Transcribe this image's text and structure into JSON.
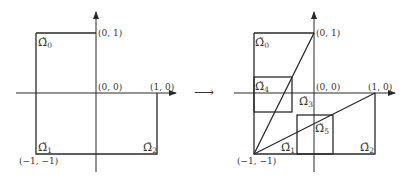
{
  "figure": {
    "left_panel": {
      "points": {
        "p01": "(0, 1)",
        "p00": "(0, 0)",
        "p10": "(1, 0)",
        "pmm": "(−1, −1)"
      },
      "regions": [
        {
          "symbol": "Ω̃",
          "sub": "0"
        },
        {
          "symbol": "Ω̃",
          "sub": "1"
        },
        {
          "symbol": "Ω̃",
          "sub": "2"
        }
      ]
    },
    "transition_arrow": "⟶",
    "right_panel": {
      "points": {
        "p01": "(0, 1)",
        "p00": "(0, 0)",
        "p10": "(1, 0)",
        "pmm": "(−1, −1)"
      },
      "regions": [
        {
          "symbol": "Ω̃",
          "sub": "0"
        },
        {
          "symbol": "Ω̃",
          "sub": "4"
        },
        {
          "symbol": "Ω̃",
          "sub": "3"
        },
        {
          "symbol": "Ω̃",
          "sub": "5"
        },
        {
          "symbol": "Ω̃",
          "sub": "1"
        },
        {
          "symbol": "Ω̃",
          "sub": "2"
        }
      ]
    }
  }
}
